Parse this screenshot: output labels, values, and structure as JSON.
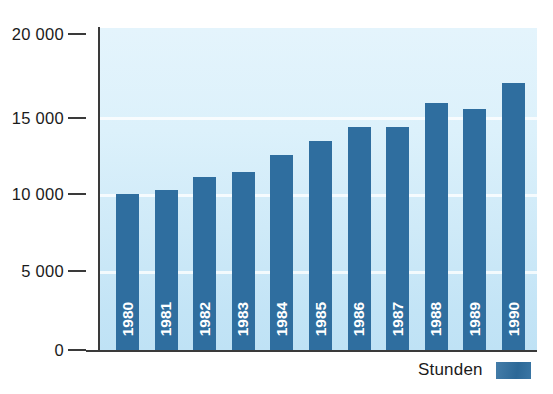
{
  "chart_data": {
    "type": "bar",
    "title": "",
    "subtitle": "",
    "xlabel": "",
    "ylabel": "",
    "categories": [
      "1980",
      "1981",
      "1982",
      "1983",
      "1984",
      "1985",
      "1986",
      "1987",
      "1988",
      "1989",
      "1990"
    ],
    "values": [
      9700,
      9950,
      10750,
      11050,
      12100,
      13000,
      13850,
      13850,
      15350,
      14950,
      16600
    ],
    "series": [
      {
        "name": "Stunden",
        "color": "#2f6e9f",
        "values": [
          9700,
          9950,
          10750,
          11050,
          12100,
          13000,
          13850,
          13850,
          15350,
          14950,
          16600
        ]
      }
    ],
    "ylim": [
      0,
      20000
    ],
    "y_ticks": [
      0,
      5000,
      10000,
      15000,
      20000
    ],
    "y_tick_labels": [
      "0",
      "5 000",
      "10 000",
      "15 000",
      "20 000"
    ],
    "grid": true,
    "grid_axis": "y",
    "legend_position": "bottom-right",
    "legend_entries": [
      "Stunden"
    ],
    "annotations": [],
    "bar_label_orientation": "vertical-rotated-90",
    "bar_label_color": "#ffffff",
    "plot_background": "#dcf1fb",
    "axis_color": "#3a3a3a"
  },
  "legend": {
    "label": "Stunden",
    "swatch_color": "#2f6e9f"
  },
  "axis": {
    "y_labels": [
      "20 000",
      "15 000",
      "10 000",
      "5 000",
      "0"
    ]
  }
}
